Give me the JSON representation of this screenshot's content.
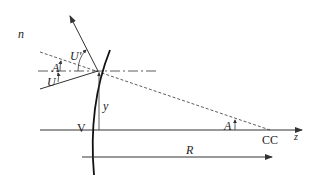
{
  "diagram": {
    "labels": {
      "n": "n",
      "U_prime": "U'",
      "A_top": "A",
      "U": "U",
      "y": "y",
      "V": "V",
      "A_bottom": "A",
      "CC": "CC",
      "z": "z",
      "R": "R"
    },
    "colors": {
      "line": "#333333",
      "background": "#ffffff"
    }
  }
}
